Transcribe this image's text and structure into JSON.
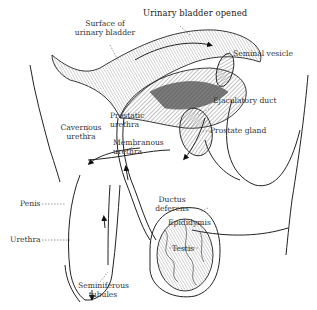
{
  "diagram": {
    "type": "anatomical illustration",
    "labels": {
      "urinary_bladder_opened": "Urinary bladder opened",
      "surface_of_urinary_bladder_1": "Surface of",
      "surface_of_urinary_bladder_2": "urinary bladder",
      "seminal_vesicle": "Seminal vesicle",
      "ejaculatory_duct": "Ejaculatory duct",
      "prostatic_urethra_1": "Prostatic",
      "prostatic_urethra_2": "urethra",
      "prostate_gland": "Prostate gland",
      "cavernous_urethra_1": "Cavernous",
      "cavernous_urethra_2": "urethra",
      "membranous_urethra_1": "Membranous",
      "membranous_urethra_2": "urethra",
      "penis": "Penis",
      "ductus_deferens_1": "Ductus",
      "ductus_deferens_2": "deferens",
      "epididymis": "Epididymis",
      "urethra": "Urethra",
      "testis": "Testis",
      "seminiferous_tubules_1": "Seminiferous",
      "seminiferous_tubules_2": "tubules"
    },
    "colors": {
      "line": "#222222",
      "hatch": "#555555",
      "background": "#ffffff"
    }
  }
}
